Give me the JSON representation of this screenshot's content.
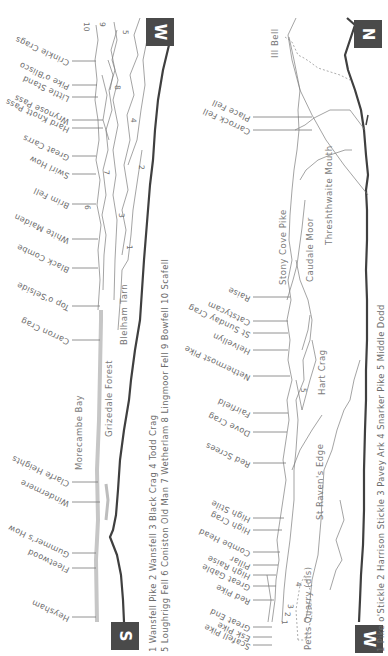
{
  "panorama_1": {
    "start_badge": "S",
    "end_badge": "W",
    "peak_labels": [
      "Heysham",
      "Fleetwood",
      "Gummer's How",
      "Windermere",
      "Clarfe Heights",
      "Carron Crag",
      "Top o'Selside",
      "Black Combe",
      "White Maiden",
      "Brim Fell",
      "Swirl How",
      "Great Carrs",
      "Hard Knott Pass",
      "Wrynose Pass",
      "Little Stand",
      "Pike o'Blisco",
      "Crinkle Crags"
    ],
    "area_labels": {
      "bay": "Morecambe Bay",
      "forest": "Grizedale Forest",
      "tarn": "Blelham Tarn"
    },
    "ridge_numbers": [
      "1",
      "2",
      "3",
      "4",
      "5",
      "6",
      "7",
      "8",
      "9",
      "10"
    ],
    "key_line_1": "1 Wansfell Pike  2 Wansfell  3 Black Crag  4 Todd Crag",
    "key_line_2": "5 Loughrigg Fell  6 Coniston Old Man  7 Wetherlam  8 Lingmoor Fell  9 Bowfell  10 Scafell"
  },
  "panorama_2": {
    "start_badge": "W",
    "end_badge": "N",
    "peak_labels": [
      "Scafell Pike",
      "Esk Pike",
      "Great End",
      "Red Pike",
      "Great Gable",
      "High Raise",
      "Pillar",
      "Combe Head",
      "High Crag",
      "High Stile",
      "Red Screes",
      "Dove Crag",
      "Fairfield",
      "Nethermost Pike",
      "Helvellyn",
      "St Sunday Crag",
      "Catstycam",
      "Raise",
      "Carrock Fell",
      "Place Fell"
    ],
    "area_labels": {
      "quarry": "Petts Quarry (dis)",
      "edge": "St Raven's Edge",
      "hart": "Hart Crag",
      "stony": "Stony Cove Pike",
      "caudale": "Caudale Moor",
      "mouth": "Threshthwaite Mouth",
      "ill_bell": "Ill Bell"
    },
    "ridge_numbers": [
      "1",
      "2",
      "3",
      "4",
      "5"
    ],
    "key_line": "1 Pike o'Stickle  2 Harrison Stickle  3 Pavey Ark  4 Snarker Pike  5 Middle Dodd"
  },
  "colors": {
    "badge": "#4a4a4a",
    "ground_line": "#3f3f3f",
    "sea_band": "#c6c6c6",
    "text": "#6d6d6d"
  }
}
